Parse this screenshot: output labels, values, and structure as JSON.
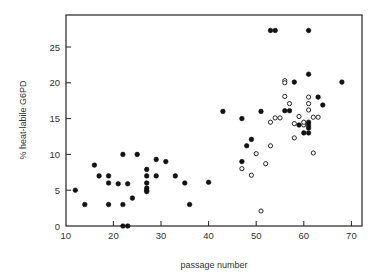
{
  "chart_data": {
    "type": "scatter",
    "title": "",
    "xlabel": "passage number",
    "ylabel": "% heat-labile G6PD",
    "xlim": [
      10,
      72
    ],
    "ylim": [
      0,
      29.5
    ],
    "xticks": [
      10,
      20,
      30,
      40,
      50,
      60,
      70
    ],
    "yticks": [
      0,
      5,
      10,
      15,
      20,
      25
    ],
    "grid": false,
    "legend": null,
    "series": [
      {
        "name": "filled",
        "marker": "filled-circle",
        "color": "#111111",
        "points": [
          [
            12,
            5.0
          ],
          [
            14,
            3.0
          ],
          [
            16,
            8.5
          ],
          [
            17,
            7.0
          ],
          [
            19,
            7.0
          ],
          [
            19,
            6.0
          ],
          [
            19,
            3.0
          ],
          [
            21,
            5.9
          ],
          [
            22,
            10.0
          ],
          [
            22,
            3.0
          ],
          [
            22,
            0.0
          ],
          [
            23,
            0.0
          ],
          [
            23,
            5.9
          ],
          [
            24,
            3.9
          ],
          [
            25,
            10.0
          ],
          [
            27,
            7.9
          ],
          [
            27,
            7.0
          ],
          [
            27,
            6.0
          ],
          [
            27,
            5.3
          ],
          [
            27,
            5.0
          ],
          [
            27,
            4.8
          ],
          [
            29,
            9.3
          ],
          [
            29,
            7.0
          ],
          [
            31,
            9.0
          ],
          [
            33,
            7.0
          ],
          [
            35,
            6.0
          ],
          [
            36,
            3.0
          ],
          [
            40,
            6.1
          ],
          [
            43,
            16.0
          ],
          [
            47,
            15.0
          ],
          [
            47,
            9.0
          ],
          [
            48,
            11.2
          ],
          [
            49,
            12.1
          ],
          [
            51,
            16.0
          ],
          [
            53,
            27.3
          ],
          [
            54,
            27.3
          ],
          [
            56,
            16.1
          ],
          [
            57,
            16.1
          ],
          [
            58,
            20.1
          ],
          [
            59,
            14.1
          ],
          [
            60,
            13.0
          ],
          [
            61,
            27.3
          ],
          [
            61,
            21.2
          ],
          [
            61,
            14.5
          ],
          [
            61,
            14.1
          ],
          [
            61,
            13.7
          ],
          [
            61,
            13.0
          ],
          [
            63,
            18.0
          ],
          [
            64,
            16.9
          ],
          [
            68,
            20.1
          ]
        ]
      },
      {
        "name": "open",
        "marker": "open-circle",
        "color": "#111111",
        "points": [
          [
            47,
            8.0
          ],
          [
            49,
            7.1
          ],
          [
            50,
            10.1
          ],
          [
            51,
            2.1
          ],
          [
            52,
            8.7
          ],
          [
            53,
            11.2
          ],
          [
            53,
            14.5
          ],
          [
            54,
            15.1
          ],
          [
            55,
            15.1
          ],
          [
            56,
            18.1
          ],
          [
            56,
            20.3
          ],
          [
            56,
            20.0
          ],
          [
            57,
            17.1
          ],
          [
            58,
            14.3
          ],
          [
            58,
            12.3
          ],
          [
            59,
            15.3
          ],
          [
            60,
            14.1
          ],
          [
            60,
            14.5
          ],
          [
            61,
            18.0
          ],
          [
            61,
            17.1
          ],
          [
            61,
            16.2
          ],
          [
            62,
            15.2
          ],
          [
            62,
            10.2
          ],
          [
            63,
            15.2
          ]
        ]
      }
    ]
  },
  "axes": {
    "x_label": "passage number",
    "y_label": "% heat-labile G6PD",
    "x_tick_labels": [
      "10",
      "20",
      "30",
      "40",
      "50",
      "60",
      "70"
    ],
    "y_tick_labels": [
      "0",
      "5",
      "10",
      "15",
      "20",
      "25"
    ]
  },
  "layout": {
    "frame": {
      "left": 66,
      "top": 15,
      "right": 362,
      "bottom": 226
    },
    "x_map": {
      "v0": 10,
      "px0": 65.8,
      "px_per_unit": 4.76
    },
    "y_map": {
      "v0": 0,
      "px0": 226,
      "px_per_unit": 7.16
    }
  }
}
